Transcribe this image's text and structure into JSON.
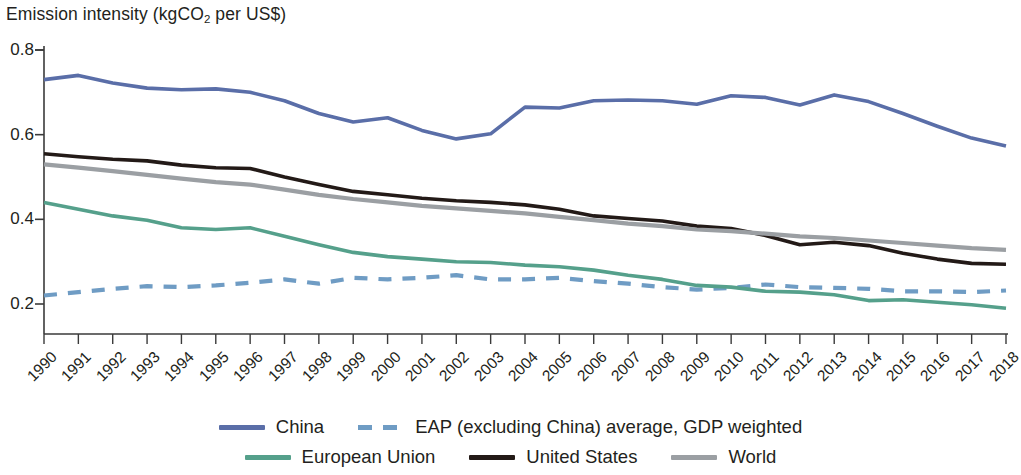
{
  "title": {
    "prefix": "Emission intensity (kgCO",
    "sub": "2",
    "suffix": " per US$)"
  },
  "axes": {
    "y_ticks": [
      "0.8",
      "0.6",
      "0.4",
      "0.2"
    ],
    "x_ticks": [
      "1990",
      "1991",
      "1992",
      "1993",
      "1994",
      "1995",
      "1996",
      "1997",
      "1998",
      "1999",
      "2000",
      "2001",
      "2002",
      "2003",
      "2004",
      "2005",
      "2006",
      "2007",
      "2008",
      "2009",
      "2010",
      "2011",
      "2012",
      "2013",
      "2014",
      "2015",
      "2016",
      "2017",
      "2018"
    ]
  },
  "legend": {
    "row1": [
      {
        "label": "China",
        "color": "#5a6ea8",
        "style": "solid",
        "name": "legend-item-china"
      },
      {
        "label": "EAP (excluding China) average, GDP weighted",
        "color": "#6f9cc4",
        "style": "dashed",
        "name": "legend-item-eap"
      }
    ],
    "row2": [
      {
        "label": "European Union",
        "color": "#55a08b",
        "style": "solid",
        "name": "legend-item-european-union"
      },
      {
        "label": "United States",
        "color": "#231a17",
        "style": "solid",
        "name": "legend-item-united-states"
      },
      {
        "label": "World",
        "color": "#9b9fa3",
        "style": "solid",
        "name": "legend-item-world"
      }
    ]
  },
  "chart_data": {
    "type": "line",
    "title": "Emission intensity (kgCO2 per US$)",
    "xlabel": "",
    "ylabel": "Emission intensity (kgCO2 per US$)",
    "ylim": [
      0.13,
      0.8
    ],
    "yticks": [
      0.2,
      0.4,
      0.6,
      0.8
    ],
    "grid": false,
    "legend_position": "bottom",
    "x": [
      1990,
      1991,
      1992,
      1993,
      1994,
      1995,
      1996,
      1997,
      1998,
      1999,
      2000,
      2001,
      2002,
      2003,
      2004,
      2005,
      2006,
      2007,
      2008,
      2009,
      2010,
      2011,
      2012,
      2013,
      2014,
      2015,
      2016,
      2017,
      2018
    ],
    "series": [
      {
        "name": "China",
        "color": "#5a6ea8",
        "style": "solid",
        "values": [
          0.73,
          0.74,
          0.722,
          0.71,
          0.706,
          0.708,
          0.7,
          0.68,
          0.65,
          0.63,
          0.64,
          0.61,
          0.59,
          0.602,
          0.665,
          0.663,
          0.68,
          0.682,
          0.68,
          0.672,
          0.692,
          0.688,
          0.67,
          0.694,
          0.678,
          0.65,
          0.62,
          0.592,
          0.573
        ]
      },
      {
        "name": "EAP (excluding China) average, GDP weighted",
        "color": "#6f9cc4",
        "style": "dashed",
        "values": [
          0.22,
          0.228,
          0.236,
          0.242,
          0.24,
          0.244,
          0.25,
          0.258,
          0.248,
          0.262,
          0.258,
          0.262,
          0.268,
          0.258,
          0.258,
          0.262,
          0.254,
          0.248,
          0.24,
          0.234,
          0.238,
          0.246,
          0.24,
          0.238,
          0.236,
          0.23,
          0.23,
          0.228,
          0.232
        ]
      },
      {
        "name": "European Union",
        "color": "#55a08b",
        "style": "solid",
        "values": [
          0.44,
          0.424,
          0.408,
          0.398,
          0.38,
          0.376,
          0.38,
          0.36,
          0.34,
          0.322,
          0.312,
          0.306,
          0.3,
          0.298,
          0.292,
          0.288,
          0.28,
          0.268,
          0.258,
          0.244,
          0.24,
          0.23,
          0.228,
          0.222,
          0.208,
          0.21,
          0.204,
          0.198,
          0.19
        ]
      },
      {
        "name": "United States",
        "color": "#231a17",
        "style": "solid",
        "values": [
          0.555,
          0.548,
          0.542,
          0.538,
          0.528,
          0.522,
          0.52,
          0.5,
          0.482,
          0.466,
          0.458,
          0.45,
          0.444,
          0.44,
          0.434,
          0.424,
          0.408,
          0.402,
          0.396,
          0.384,
          0.378,
          0.362,
          0.34,
          0.346,
          0.338,
          0.32,
          0.306,
          0.296,
          0.294
        ]
      },
      {
        "name": "World",
        "color": "#9b9fa3",
        "style": "solid",
        "values": [
          0.53,
          0.522,
          0.514,
          0.505,
          0.496,
          0.488,
          0.482,
          0.47,
          0.458,
          0.448,
          0.44,
          0.432,
          0.426,
          0.42,
          0.414,
          0.406,
          0.398,
          0.39,
          0.384,
          0.376,
          0.372,
          0.366,
          0.36,
          0.356,
          0.35,
          0.344,
          0.338,
          0.332,
          0.328
        ]
      }
    ]
  }
}
